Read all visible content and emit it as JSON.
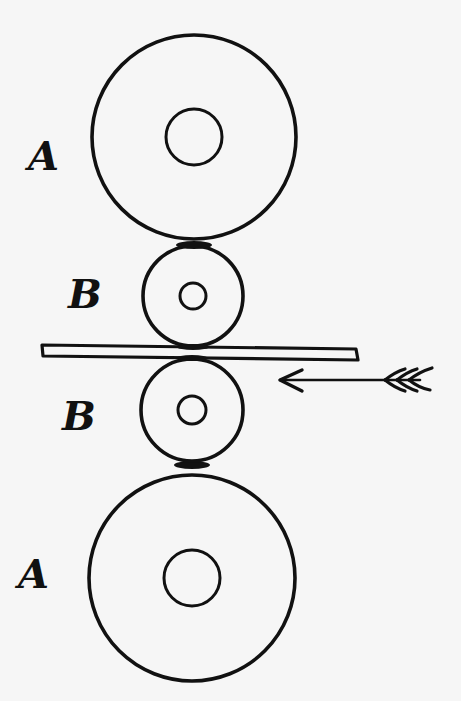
{
  "diagram": {
    "type": "rolling-mill-rollers",
    "background": "#f6f6f6",
    "ink": "#111111",
    "labels": {
      "top_large_roller": "A",
      "top_small_roller": "B",
      "bottom_small_roller": "B",
      "bottom_large_roller": "A"
    },
    "rollers": [
      {
        "id": "A-top",
        "label": "A",
        "cx": 194,
        "cy": 137,
        "r_outer": 102,
        "r_inner": 28
      },
      {
        "id": "B-top",
        "label": "B",
        "cx": 193,
        "cy": 296,
        "r_outer": 50,
        "r_inner": 13
      },
      {
        "id": "B-bottom",
        "label": "B",
        "cx": 192,
        "cy": 410,
        "r_outer": 51,
        "r_inner": 14
      },
      {
        "id": "A-bottom",
        "label": "A",
        "cx": 192,
        "cy": 578,
        "r_outer": 103,
        "r_inner": 28
      }
    ],
    "plate": {
      "x_start": 42,
      "x_end": 358
    },
    "arrow": {
      "direction": "left",
      "from_x": 435,
      "to_x": 278,
      "y": 380
    }
  }
}
